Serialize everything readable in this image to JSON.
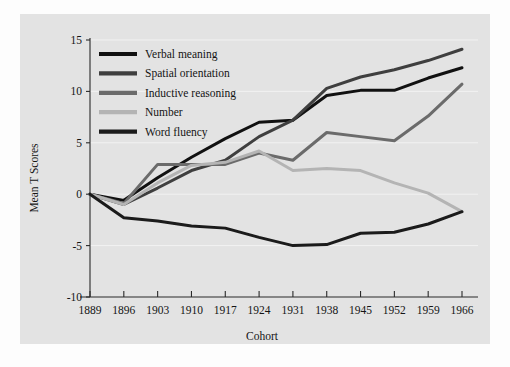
{
  "figure": {
    "background_color": "#fdfdfd",
    "plot_background_color": "#e3e3e3",
    "gridline_color": "#f2f2f2"
  },
  "chart_data": {
    "type": "line",
    "title": "",
    "xlabel": "Cohort",
    "ylabel": "Mean T Scores",
    "grid": true,
    "legend_position": "top-left",
    "xlim": [
      1889,
      1966
    ],
    "ylim": [
      -10,
      15
    ],
    "xticks": [
      1889,
      1896,
      1903,
      1910,
      1917,
      1924,
      1931,
      1938,
      1945,
      1952,
      1959,
      1966
    ],
    "xtick_labels": [
      "1889",
      "1896",
      "1903",
      "1910",
      "1917",
      "1924",
      "1931",
      "1938",
      "1945",
      "1952",
      "1959",
      "1966"
    ],
    "yticks": [
      15,
      10,
      5,
      0,
      -5,
      -10
    ],
    "ytick_labels": [
      "15",
      "10",
      "5",
      "0",
      "-5",
      "-10"
    ],
    "categories": [
      1889,
      1896,
      1903,
      1910,
      1917,
      1924,
      1931,
      1938,
      1945,
      1952,
      1959,
      1966
    ],
    "series": [
      {
        "name": "Verbal meaning",
        "color": "#111111",
        "width": 3.0,
        "values": [
          0.0,
          -0.6,
          1.6,
          3.6,
          5.4,
          7.0,
          7.2,
          9.6,
          10.1,
          10.1,
          11.3,
          12.3
        ]
      },
      {
        "name": "Spatial orientation",
        "color": "#3f3f3f",
        "width": 3.0,
        "values": [
          0.0,
          -1.0,
          0.6,
          2.3,
          3.3,
          5.6,
          7.2,
          10.3,
          11.4,
          12.1,
          13.0,
          14.1
        ]
      },
      {
        "name": "Inductive reasoning",
        "color": "#6b6b6b",
        "width": 3.0,
        "values": [
          0.0,
          -0.9,
          2.9,
          2.9,
          2.9,
          4.0,
          3.3,
          6.0,
          5.6,
          5.2,
          7.6,
          10.7
        ]
      },
      {
        "name": "Number",
        "color": "#b4b4b4",
        "width": 3.0,
        "values": [
          0.0,
          -1.0,
          1.1,
          2.8,
          3.1,
          4.2,
          2.3,
          2.5,
          2.3,
          1.1,
          0.1,
          -1.7
        ]
      },
      {
        "name": "Word fluency",
        "color": "#1b1b1b",
        "width": 3.0,
        "values": [
          0.0,
          -2.3,
          -2.6,
          -3.1,
          -3.3,
          -4.2,
          -5.0,
          -4.9,
          -3.8,
          -3.7,
          -2.9,
          -1.7
        ]
      }
    ]
  },
  "legend": {
    "entries": [
      {
        "label": "Verbal meaning",
        "color": "#111111"
      },
      {
        "label": "Spatial orientation",
        "color": "#3f3f3f"
      },
      {
        "label": "Inductive reasoning",
        "color": "#6b6b6b"
      },
      {
        "label": "Number",
        "color": "#b4b4b4"
      },
      {
        "label": "Word fluency",
        "color": "#1b1b1b"
      }
    ]
  }
}
